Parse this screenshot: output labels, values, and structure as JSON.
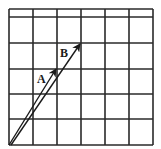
{
  "diagram": {
    "grid": {
      "x_lines": [
        9,
        33,
        57,
        81,
        105,
        129,
        153
      ],
      "y_lines": [
        9,
        17,
        43,
        69,
        94,
        119,
        145
      ],
      "color": "#2a2a2a"
    },
    "vectors": [
      {
        "label": "A",
        "x1": 9,
        "y1": 145,
        "x2": 56,
        "y2": 69,
        "label_x": 37,
        "label_y": 83
      },
      {
        "label": "B",
        "x1": 11,
        "y1": 145,
        "x2": 80,
        "y2": 44,
        "label_x": 60,
        "label_y": 57
      }
    ]
  }
}
